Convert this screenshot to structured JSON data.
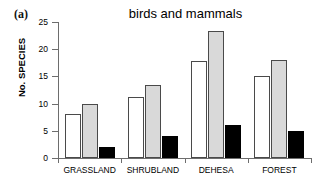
{
  "panel": {
    "label": "(a)"
  },
  "chart_data": {
    "type": "bar",
    "title": "birds and mammals",
    "xlabel": "",
    "ylabel": "No. SPECIES",
    "ylim": [
      0,
      25
    ],
    "yticks": [
      0,
      5,
      10,
      15,
      20,
      25
    ],
    "ytick_labels": [
      "0",
      "5",
      "10",
      "15",
      "20",
      "25"
    ],
    "grid": false,
    "legend": "none",
    "categories": [
      "GRASSLAND",
      "SHRUBLAND",
      "DEHESA",
      "FOREST"
    ],
    "series": [
      {
        "name": "white",
        "color": "#ffffff",
        "values": [
          8.0,
          11.2,
          17.8,
          15.1
        ]
      },
      {
        "name": "gray",
        "color": "#d9d9d9",
        "values": [
          9.9,
          13.5,
          23.3,
          18.0
        ]
      },
      {
        "name": "black",
        "color": "#000000",
        "values": [
          2.0,
          4.0,
          6.0,
          5.0
        ]
      }
    ]
  },
  "colors": {
    "axis": "#6d6d6d",
    "bar_outline": "#4a4a4a",
    "text": "#000000",
    "background": "#ffffff"
  }
}
